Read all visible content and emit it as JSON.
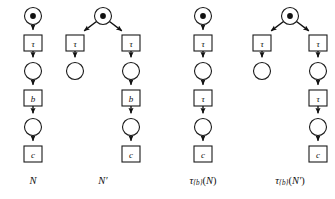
{
  "figure": {
    "name": "petri-net-tau-abstraction-figure",
    "background_color": "#ffffff",
    "stroke_color": "#111111",
    "fill_color": "#ffffff"
  },
  "nets": [
    {
      "id": "net-N",
      "caption": "N",
      "caption_parts": {
        "base": "N",
        "prime": ""
      },
      "places": [
        {
          "id": "N-p0",
          "cx": 33,
          "cy": 16,
          "r": 8.5,
          "tokens": 1
        },
        {
          "id": "N-p1",
          "cx": 33,
          "cy": 71,
          "r": 8.5,
          "tokens": 0
        },
        {
          "id": "N-p2",
          "cx": 33,
          "cy": 127,
          "r": 8.5,
          "tokens": 0
        }
      ],
      "transitions": [
        {
          "id": "N-t0",
          "label": "τ",
          "x": 24,
          "y": 35,
          "w": 18,
          "h": 16
        },
        {
          "id": "N-t1",
          "label": "b",
          "x": 24,
          "y": 90,
          "w": 18,
          "h": 16
        },
        {
          "id": "N-t2",
          "label": "c",
          "x": 24,
          "y": 146,
          "w": 18,
          "h": 16
        }
      ],
      "arcs": [
        {
          "id": "N-a0",
          "x1": 33,
          "y1": 24.5,
          "x2": 33,
          "y2": 35
        },
        {
          "id": "N-a1",
          "x1": 33,
          "y1": 51,
          "x2": 33,
          "y2": 62.5
        },
        {
          "id": "N-a2",
          "x1": 33,
          "y1": 79.5,
          "x2": 33,
          "y2": 90
        },
        {
          "id": "N-a3",
          "x1": 33,
          "y1": 106,
          "x2": 33,
          "y2": 118.5
        },
        {
          "id": "N-a4",
          "x1": 33,
          "y1": 135.5,
          "x2": 33,
          "y2": 146
        }
      ],
      "caption_x": 33,
      "caption_y": 180
    },
    {
      "id": "net-Nprime",
      "caption": "N′",
      "caption_parts": {
        "base": "N",
        "prime": "′"
      },
      "places": [
        {
          "id": "Np-p0",
          "cx": 103,
          "cy": 16,
          "r": 8.5,
          "tokens": 1
        },
        {
          "id": "Np-p1",
          "cx": 75,
          "cy": 71,
          "r": 8.5,
          "tokens": 0
        },
        {
          "id": "Np-p2",
          "cx": 131,
          "cy": 71,
          "r": 8.5,
          "tokens": 0
        },
        {
          "id": "Np-p3",
          "cx": 131,
          "cy": 127,
          "r": 8.5,
          "tokens": 0
        }
      ],
      "transitions": [
        {
          "id": "Np-t0",
          "label": "τ",
          "x": 66,
          "y": 35,
          "w": 18,
          "h": 16
        },
        {
          "id": "Np-t1",
          "label": "τ",
          "x": 122,
          "y": 35,
          "w": 18,
          "h": 16
        },
        {
          "id": "Np-t2",
          "label": "b",
          "x": 122,
          "y": 90,
          "w": 18,
          "h": 16
        },
        {
          "id": "Np-t3",
          "label": "c",
          "x": 122,
          "y": 146,
          "w": 18,
          "h": 16
        }
      ],
      "arcs": [
        {
          "id": "Np-a0",
          "x1": 96.5,
          "y1": 21.5,
          "x2": 80,
          "y2": 34
        },
        {
          "id": "Np-a1",
          "x1": 109.5,
          "y1": 21.5,
          "x2": 126,
          "y2": 34
        },
        {
          "id": "Np-a2",
          "x1": 75,
          "y1": 51,
          "x2": 75,
          "y2": 62.5
        },
        {
          "id": "Np-a3",
          "x1": 131,
          "y1": 51,
          "x2": 131,
          "y2": 62.5
        },
        {
          "id": "Np-a4",
          "x1": 131,
          "y1": 79.5,
          "x2": 131,
          "y2": 90
        },
        {
          "id": "Np-a5",
          "x1": 131,
          "y1": 106,
          "x2": 131,
          "y2": 118.5
        },
        {
          "id": "Np-a6",
          "x1": 131,
          "y1": 135.5,
          "x2": 131,
          "y2": 146
        }
      ],
      "caption_x": 103,
      "caption_y": 180
    },
    {
      "id": "net-tau-b-N",
      "caption": "τ{b}(N)",
      "caption_parts": {
        "tau": "τ",
        "sub": "{b}",
        "arg_open": "(",
        "base": "N",
        "prime": "",
        "arg_close": ")"
      },
      "places": [
        {
          "id": "TN-p0",
          "cx": 203,
          "cy": 16,
          "r": 8.5,
          "tokens": 1
        },
        {
          "id": "TN-p1",
          "cx": 203,
          "cy": 71,
          "r": 8.5,
          "tokens": 0
        },
        {
          "id": "TN-p2",
          "cx": 203,
          "cy": 127,
          "r": 8.5,
          "tokens": 0
        }
      ],
      "transitions": [
        {
          "id": "TN-t0",
          "label": "τ",
          "x": 194,
          "y": 35,
          "w": 18,
          "h": 16
        },
        {
          "id": "TN-t1",
          "label": "τ",
          "x": 194,
          "y": 90,
          "w": 18,
          "h": 16
        },
        {
          "id": "TN-t2",
          "label": "c",
          "x": 194,
          "y": 146,
          "w": 18,
          "h": 16
        }
      ],
      "arcs": [
        {
          "id": "TN-a0",
          "x1": 203,
          "y1": 24.5,
          "x2": 203,
          "y2": 35
        },
        {
          "id": "TN-a1",
          "x1": 203,
          "y1": 51,
          "x2": 203,
          "y2": 62.5
        },
        {
          "id": "TN-a2",
          "x1": 203,
          "y1": 79.5,
          "x2": 203,
          "y2": 90
        },
        {
          "id": "TN-a3",
          "x1": 203,
          "y1": 106,
          "x2": 203,
          "y2": 118.5
        },
        {
          "id": "TN-a4",
          "x1": 203,
          "y1": 135.5,
          "x2": 203,
          "y2": 146
        }
      ],
      "caption_x": 203,
      "caption_y": 180
    },
    {
      "id": "net-tau-b-Nprime",
      "caption": "τ{b}(N′)",
      "caption_parts": {
        "tau": "τ",
        "sub": "{b}",
        "arg_open": "(",
        "base": "N",
        "prime": "′",
        "arg_close": ")"
      },
      "places": [
        {
          "id": "TNp-p0",
          "cx": 290,
          "cy": 16,
          "r": 8.5,
          "tokens": 1
        },
        {
          "id": "TNp-p1",
          "cx": 262,
          "cy": 71,
          "r": 8.5,
          "tokens": 0
        },
        {
          "id": "TNp-p2",
          "cx": 318,
          "cy": 71,
          "r": 8.5,
          "tokens": 0
        },
        {
          "id": "TNp-p3",
          "cx": 318,
          "cy": 127,
          "r": 8.5,
          "tokens": 0
        }
      ],
      "transitions": [
        {
          "id": "TNp-t0",
          "label": "τ",
          "x": 253,
          "y": 35,
          "w": 18,
          "h": 16
        },
        {
          "id": "TNp-t1",
          "label": "τ",
          "x": 309,
          "y": 35,
          "w": 18,
          "h": 16
        },
        {
          "id": "TNp-t2",
          "label": "τ",
          "x": 309,
          "y": 90,
          "w": 18,
          "h": 16
        },
        {
          "id": "TNp-t3",
          "label": "c",
          "x": 309,
          "y": 146,
          "w": 18,
          "h": 16
        }
      ],
      "arcs": [
        {
          "id": "TNp-a0",
          "x1": 283.5,
          "y1": 21.5,
          "x2": 267,
          "y2": 34
        },
        {
          "id": "TNp-a1",
          "x1": 296.5,
          "y1": 21.5,
          "x2": 313,
          "y2": 34
        },
        {
          "id": "TNp-a2",
          "x1": 262,
          "y1": 51,
          "x2": 262,
          "y2": 62.5
        },
        {
          "id": "TNp-a3",
          "x1": 318,
          "y1": 51,
          "x2": 318,
          "y2": 62.5
        },
        {
          "id": "TNp-a4",
          "x1": 318,
          "y1": 79.5,
          "x2": 318,
          "y2": 90
        },
        {
          "id": "TNp-a5",
          "x1": 318,
          "y1": 106,
          "x2": 318,
          "y2": 118.5
        },
        {
          "id": "TNp-a6",
          "x1": 318,
          "y1": 135.5,
          "x2": 318,
          "y2": 146
        }
      ],
      "caption_x": 290,
      "caption_y": 180
    }
  ]
}
